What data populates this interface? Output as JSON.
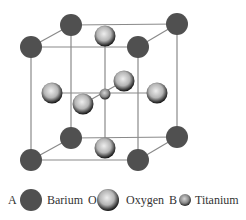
{
  "figure": {
    "type": "perovskite crystal structure (ABO3 unit cell)",
    "colors": {
      "barium": "#505050",
      "oxygen_light": "#e2e2e2",
      "oxygen_dark": "#1e1e1e",
      "titanium_light": "#cfcfcf",
      "titanium_dark": "#2a2a2a",
      "edge": "#8a8a8a",
      "text": "#333333"
    }
  },
  "legend": {
    "items": [
      {
        "site": "A",
        "label": "Barium",
        "icon": "barium-atom-icon"
      },
      {
        "site": "O",
        "label": "Oxygen",
        "icon": "oxygen-atom-icon"
      },
      {
        "site": "B",
        "label": "Titanium",
        "icon": "titanium-atom-icon"
      }
    ]
  }
}
